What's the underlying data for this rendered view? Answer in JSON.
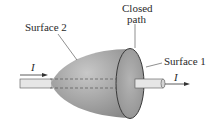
{
  "labels": {
    "surface2": "Surface 2",
    "closed_path_line1": "Closed",
    "closed_path_line2": "path",
    "surface1": "Surface 1",
    "current_in": "I",
    "current_out": "I"
  },
  "colors": {
    "surface_fill": "#9a9a9a",
    "wire_fill": "#e4e4e4",
    "outline": "#3a3a3a",
    "text": "#2a2a2a"
  }
}
